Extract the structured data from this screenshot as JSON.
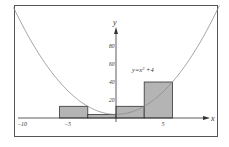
{
  "chart_data": {
    "type": "bar",
    "title": "",
    "xlabel": "x",
    "ylabel": "y",
    "annotation": "y=x²+4",
    "function": "x^2+4",
    "x_ticks": [
      {
        "value": -10,
        "label": "−10"
      },
      {
        "value": -5,
        "label": "−5"
      },
      {
        "value": 5,
        "label": "5"
      }
    ],
    "y_ticks": [
      {
        "value": 20,
        "label": "20"
      },
      {
        "value": 40,
        "label": "40"
      },
      {
        "value": 60,
        "label": "60"
      },
      {
        "value": 80,
        "label": "80"
      }
    ],
    "bars": [
      {
        "x0": -6,
        "x1": -3,
        "height": 13
      },
      {
        "x0": -3,
        "x1": 0,
        "height": 4
      },
      {
        "x0": 0,
        "x1": 3,
        "height": 13
      },
      {
        "x0": 3,
        "x1": 6,
        "height": 40
      }
    ],
    "xlim": [
      -10.5,
      12
    ],
    "ylim": [
      0,
      125
    ],
    "grid": false,
    "legend": "none"
  },
  "colors": {
    "bar_fill": "#b4b4b4",
    "bar_stroke": "#333333",
    "curve": "#8a8a8a",
    "axis": "#333333",
    "frame": "#555555"
  }
}
